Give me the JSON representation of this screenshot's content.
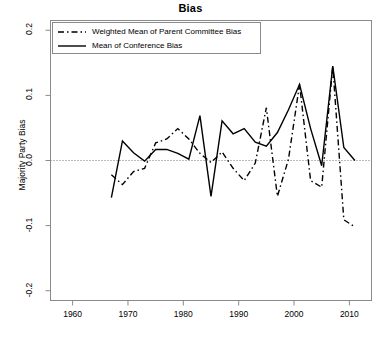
{
  "chart_data": {
    "type": "line",
    "title": "Bias",
    "xlabel": "",
    "ylabel": "Majority Party Bias",
    "xlim": [
      1956,
      2014
    ],
    "ylim": [
      -0.215,
      0.215
    ],
    "xticks": [
      1960,
      1970,
      1980,
      1990,
      2000,
      2010
    ],
    "xtick_labels": [
      "1960",
      "1970",
      "1980",
      "1990",
      "2000",
      "2010"
    ],
    "yticks": [
      -0.2,
      -0.1,
      0.0,
      0.1,
      0.2
    ],
    "ytick_labels": [
      "-0.2",
      "-0.1",
      "0.0",
      "0.1",
      "0.2"
    ],
    "grid": false,
    "zero_reference_line": 0.0,
    "zero_line_style": "dotted",
    "legend_position": "top-left",
    "x": [
      1967,
      1969,
      1971,
      1973,
      1975,
      1977,
      1979,
      1981,
      1983,
      1985,
      1987,
      1989,
      1991,
      1993,
      1995,
      1997,
      1999,
      2001,
      2003,
      2005,
      2007,
      2009,
      2011
    ],
    "series": [
      {
        "name": "Weighted Mean of Parent Committee Bias",
        "style": "dashed",
        "color": "#000000",
        "values": [
          -0.022,
          -0.037,
          -0.017,
          -0.012,
          0.027,
          0.033,
          0.049,
          0.033,
          0.011,
          -0.003,
          0.013,
          -0.012,
          -0.031,
          -0.004,
          0.081,
          -0.055,
          0.002,
          0.117,
          -0.031,
          -0.041,
          0.145,
          -0.091,
          -0.102
        ]
      },
      {
        "name": "Mean of Conference Bias",
        "style": "solid",
        "color": "#000000",
        "values": [
          -0.057,
          0.03,
          0.012,
          -0.001,
          0.017,
          0.017,
          0.011,
          0.002,
          0.069,
          -0.055,
          0.061,
          0.041,
          0.049,
          0.028,
          0.022,
          0.043,
          0.078,
          0.117,
          0.049,
          -0.008,
          0.145,
          0.02,
          0.0
        ]
      }
    ]
  },
  "legend": {
    "entries": [
      {
        "label": "Weighted Mean of Parent Committee Bias",
        "icon": "dashed-line-swatch"
      },
      {
        "label": "Mean of Conference Bias",
        "icon": "solid-line-swatch"
      }
    ]
  },
  "colors": {
    "line": "#000000",
    "axis": "#8a8a8a",
    "background": "#ffffff",
    "zero_line": "#777777"
  }
}
